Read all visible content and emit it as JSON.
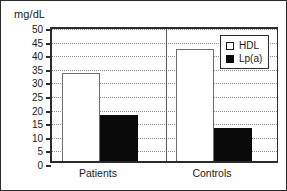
{
  "chart_data": {
    "type": "bar",
    "title": "",
    "xlabel": "",
    "ylabel": "mg/dL",
    "ylim": [
      0,
      50
    ],
    "yticks": [
      0,
      5,
      10,
      15,
      20,
      25,
      30,
      35,
      40,
      45,
      50
    ],
    "ytick_labels": [
      "0",
      "5",
      "10",
      "15",
      "20",
      "25",
      "30",
      "35",
      "40",
      "45",
      "50"
    ],
    "grid": "horizontal-dotted",
    "legend_position": "top-right",
    "categories": [
      "Patients",
      "Controls"
    ],
    "series": [
      {
        "name": "HDL",
        "values": [
          32.5,
          41
        ],
        "fill": "#ffffff",
        "edge": "#6e6e6e"
      },
      {
        "name": "Lp(a)",
        "values": [
          16.8,
          12.2
        ],
        "fill": "#0a0a0a",
        "edge": "#0a0a0a"
      }
    ]
  },
  "axis": {
    "unit_label": "mg/dL"
  },
  "legend": {
    "entries": [
      {
        "label": "HDL",
        "swatch": "open-square"
      },
      {
        "label": "Lp(a)",
        "swatch": "filled-square"
      }
    ]
  },
  "colors": {
    "frame": "#2b2b2b",
    "grid": "#8d8d8d",
    "text": "#1a1a1a",
    "hdl": "#ffffff",
    "lpa": "#0a0a0a"
  }
}
